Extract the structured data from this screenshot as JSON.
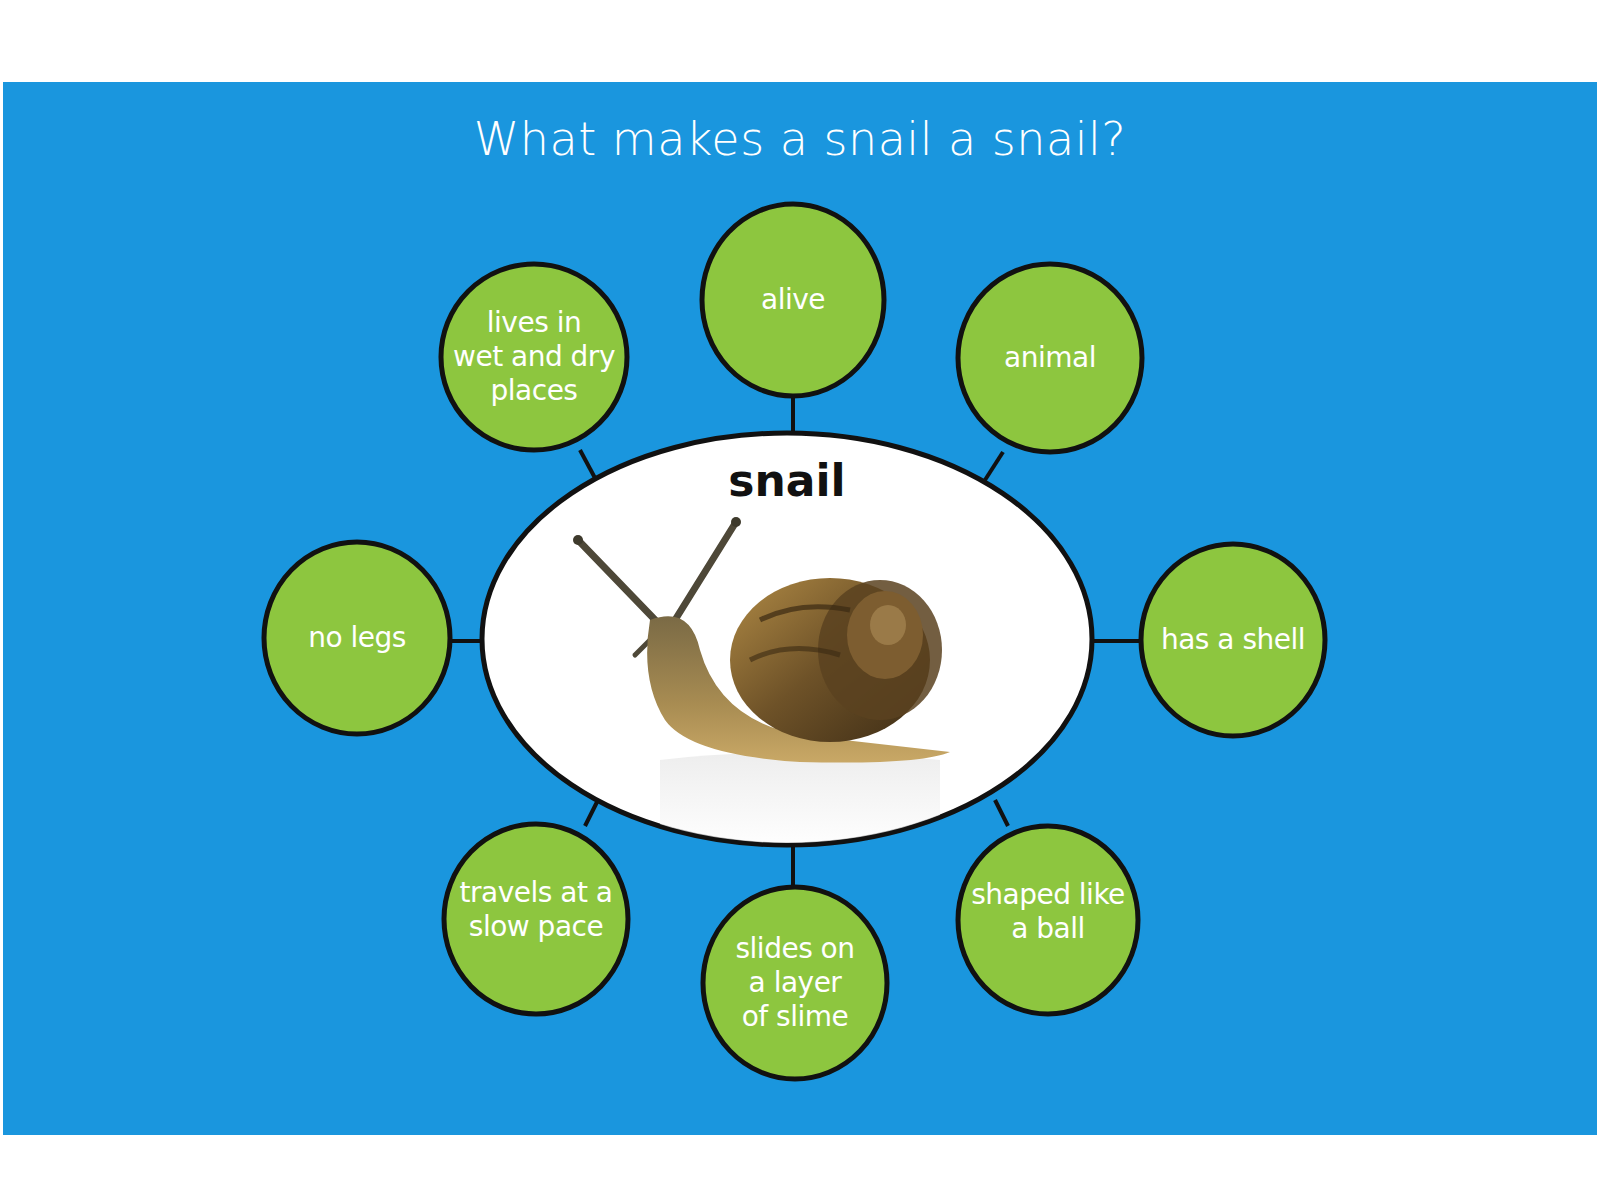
{
  "title": "What makes a snail a snail?",
  "center": {
    "label": "snail",
    "image": "snail-photo"
  },
  "colors": {
    "background_panel": "#1a96de",
    "bubble_fill": "#8dc63f",
    "outline": "#111111",
    "center_fill": "#ffffff",
    "bubble_text": "#ffffff"
  },
  "bubbles": [
    {
      "id": "alive",
      "text": "alive",
      "position": "top"
    },
    {
      "id": "animal",
      "text": "animal",
      "position": "top-right"
    },
    {
      "id": "has-a-shell",
      "text": "has a shell",
      "position": "right"
    },
    {
      "id": "shaped-like-a-ball",
      "text": "shaped like\na ball",
      "position": "bottom-right"
    },
    {
      "id": "slides-on-slime",
      "text": "slides on\na layer\nof slime",
      "position": "bottom"
    },
    {
      "id": "travels-slow",
      "text": "travels at a\nslow pace",
      "position": "bottom-left"
    },
    {
      "id": "no-legs",
      "text": "no legs",
      "position": "left"
    },
    {
      "id": "lives-wet-dry",
      "text": "lives in\nwet and dry\nplaces",
      "position": "top-left"
    }
  ]
}
